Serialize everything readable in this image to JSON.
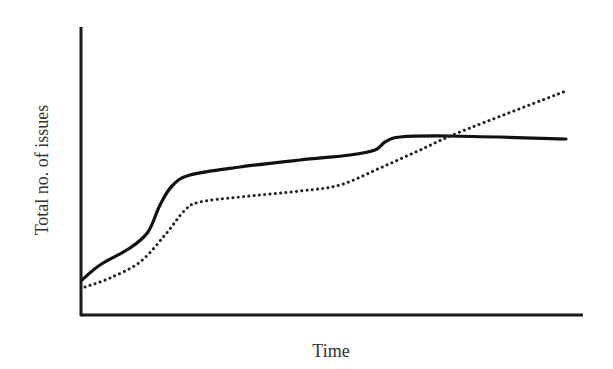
{
  "chart_data": {
    "type": "line",
    "title": "",
    "xlabel": "Time",
    "ylabel": "Total no. of issues",
    "grid": false,
    "legend": null,
    "x_ticks": [],
    "y_ticks": [],
    "x": [
      0,
      0.04,
      0.1,
      0.14,
      0.16,
      0.18,
      0.22,
      0.32,
      0.44,
      0.54,
      0.59,
      0.61,
      0.64,
      0.74,
      0.97
    ],
    "series": [
      {
        "name": "solid",
        "style": "solid",
        "color": "#111111",
        "points_px": [
          [
            82,
            280
          ],
          [
            100,
            265
          ],
          [
            130,
            248
          ],
          [
            148,
            232
          ],
          [
            160,
            205
          ],
          [
            172,
            186
          ],
          [
            190,
            175
          ],
          [
            240,
            167
          ],
          [
            300,
            160
          ],
          [
            350,
            155
          ],
          [
            375,
            150
          ],
          [
            385,
            142
          ],
          [
            400,
            137
          ],
          [
            450,
            136
          ],
          [
            566,
            139
          ]
        ]
      },
      {
        "name": "dotted",
        "style": "dotted",
        "color": "#222222",
        "points_px": [
          [
            85,
            287
          ],
          [
            110,
            278
          ],
          [
            140,
            262
          ],
          [
            165,
            235
          ],
          [
            185,
            210
          ],
          [
            200,
            202
          ],
          [
            240,
            197
          ],
          [
            300,
            191
          ],
          [
            340,
            185
          ],
          [
            380,
            168
          ],
          [
            420,
            150
          ],
          [
            460,
            132
          ],
          [
            566,
            91
          ]
        ]
      }
    ],
    "axes": {
      "origin_px": [
        81,
        315
      ],
      "y_top_px": 27,
      "x_right_px": 583
    }
  },
  "labels": {
    "x": "Time",
    "y": "Total no. of issues"
  }
}
